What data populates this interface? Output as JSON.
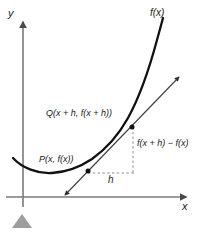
{
  "figure": {
    "type": "calculus-difference-quotient-diagram",
    "background_color": "#ffffff",
    "ink_color": "#1a1a1a",
    "axis_color": "#6b6b6b",
    "secant_color": "#4d4d4d",
    "dashed_color": "#8a8a8a",
    "marker_color": "#9a9a9a"
  },
  "axes": {
    "y_label": "y",
    "x_label": "x",
    "y_axis": {
      "x": 23,
      "top": 18,
      "bottom": 207
    },
    "x_axis": {
      "y": 197,
      "left": 6,
      "right": 188
    }
  },
  "curve": {
    "label": "f(x)",
    "stroke_width": 2.2,
    "description": "upward-opening convex curve with minimum near x=50",
    "path_points": [
      [
        14,
        160
      ],
      [
        30,
        169
      ],
      [
        50,
        173
      ],
      [
        70,
        170
      ],
      [
        88,
        162
      ],
      [
        108,
        147
      ],
      [
        125,
        127
      ],
      [
        140,
        100
      ],
      [
        152,
        68
      ],
      [
        160,
        38
      ],
      [
        165,
        18
      ]
    ]
  },
  "points": [
    {
      "name": "P",
      "label": "P(x, f(x))",
      "x": 88,
      "y": 172,
      "radius": 2.4
    },
    {
      "name": "Q",
      "label": "Q(x + h, f(x + h))",
      "x": 133,
      "y": 127,
      "radius": 2.4
    }
  ],
  "secant_line": {
    "name": "secant-line",
    "from": [
      64,
      196
    ],
    "to": [
      180,
      76
    ],
    "stroke_width": 1.1,
    "arrow_start": true,
    "arrow_end": true
  },
  "annotations": {
    "rise_label": "f(x + h) − f(x)",
    "run_label": "h",
    "rise_segment": {
      "x": 133,
      "y1": 127,
      "y2": 172
    },
    "run_segment": {
      "y": 172,
      "x1": 88,
      "x2": 133
    }
  },
  "marker": {
    "name": "page-corner-marker",
    "shape": "triangle",
    "x": 22,
    "y": 227,
    "width": 22,
    "height": 14
  }
}
